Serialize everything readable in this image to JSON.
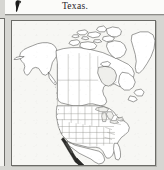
{
  "page": {
    "background_color": "#d6d6d2",
    "sheet_color": "#fbfbf9"
  },
  "caption": {
    "text": "Texas.",
    "thumbnail_icon": "map-thumbnail-icon"
  },
  "divider": {
    "name": "horizontal-rule",
    "color": "#8d8d89"
  },
  "left_crop": {
    "name": "adjacent-figure-crop",
    "border_color": "#6f6f6b"
  },
  "figure": {
    "name": "distribution-map",
    "frame_color": "#6b6b67",
    "land_color": "#ffffff",
    "ocean_color": "#f7f7f4",
    "outline_color": "#4a4a48",
    "state_border_color": "#8a8a87",
    "range_shade_color": "#2b2b29",
    "regions": [
      "Alaska",
      "Canada",
      "Canadian Arctic Archipelago",
      "Greenland",
      "Hudson Bay",
      "Great Lakes",
      "Contiguous United States",
      "Florida",
      "Mexico",
      "Baja California"
    ],
    "shaded_range": "Baja California peninsula"
  }
}
